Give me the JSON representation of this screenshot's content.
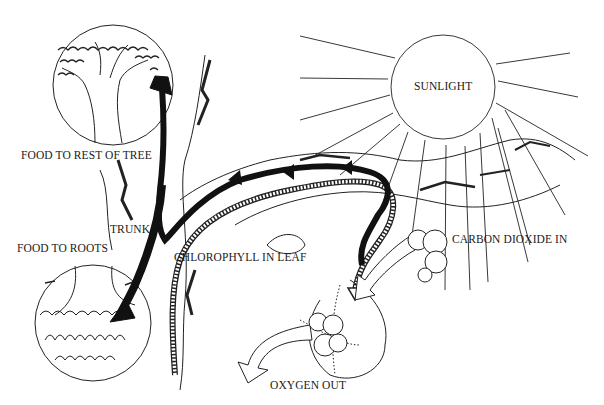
{
  "diagram": {
    "type": "illustration",
    "labels": {
      "sunlight": "SUNLIGHT",
      "food_rest": "FOOD TO REST OF TREE",
      "trunk": "TRUNK",
      "food_roots": "FOOD TO ROOTS",
      "chlorophyll": "CHLOROPHYLL IN LEAF",
      "co2": "CARBON DIOXIDE IN",
      "oxygen": "OXYGEN OUT"
    },
    "colors": {
      "ink": "#1a1a1a",
      "background": "#ffffff"
    }
  }
}
